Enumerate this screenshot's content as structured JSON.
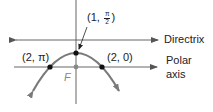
{
  "diagram": {
    "colors": {
      "axes": "#555555",
      "parabola": "#7a7a7a",
      "points": "#111111",
      "focus": "#888888",
      "text": "#222222"
    },
    "labels": {
      "vertex": {
        "prefix": "(1, ",
        "num": "π",
        "den": "2",
        "suffix": ")"
      },
      "left_point": "(2, π)",
      "right_point": "(2, 0)",
      "directrix": "Directrix",
      "polar_axis_line1": "Polar",
      "polar_axis_line2": "axis",
      "focus": "F"
    },
    "points": [
      {
        "name": "vertex",
        "polar": "(1, π/2)",
        "x": 76,
        "y": 53
      },
      {
        "name": "left",
        "polar": "(2, π)",
        "x": 50,
        "y": 67
      },
      {
        "name": "right",
        "polar": "(2, 0)",
        "x": 102,
        "y": 67
      },
      {
        "name": "focus",
        "label": "F",
        "x": 76,
        "y": 67
      }
    ]
  }
}
